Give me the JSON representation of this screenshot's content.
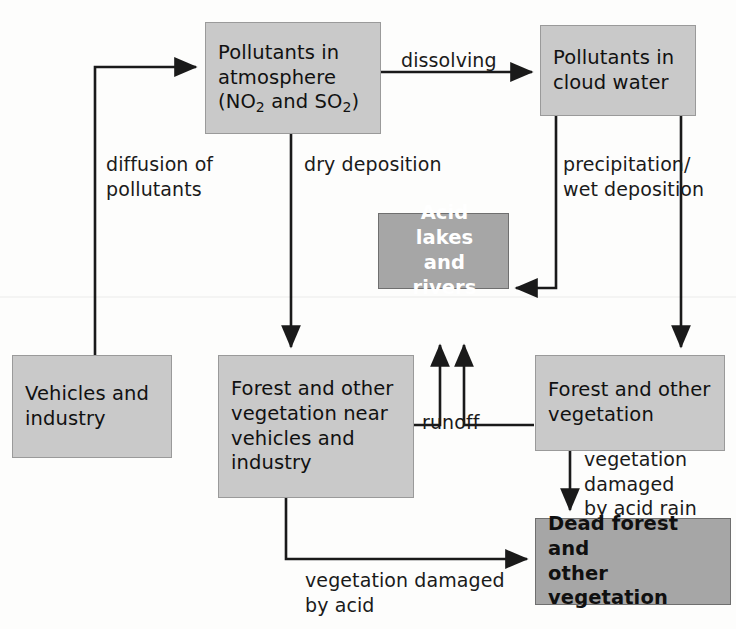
{
  "diagram": {
    "colors": {
      "box_light_fill": "#c9c9c9",
      "box_dark_fill": "#a6a6a6",
      "box_border": "#8f8f8f",
      "line": "#1a1a1a",
      "text_dark": "#111111",
      "text_light": "#ffffff",
      "background": "#fdfdfc"
    },
    "nodes": [
      {
        "id": "pollutants-atmosphere",
        "label": "Pollutants in\natmosphere\n(NO2 and SO2)",
        "label_lines": [
          "Pollutants in",
          "atmosphere",
          "(NO₂ and SO₂)"
        ],
        "style": "light"
      },
      {
        "id": "pollutants-cloud-water",
        "label": "Pollutants in\ncloud water",
        "style": "light"
      },
      {
        "id": "acid-lakes-rivers",
        "label": "Acid lakes\nand rivers",
        "style": "dark-white-text"
      },
      {
        "id": "vehicles-industry",
        "label": "Vehicles and\nindustry",
        "style": "light"
      },
      {
        "id": "forest-near-vehicles",
        "label": "Forest and other\nvegetation near\nvehicles and\nindustry",
        "style": "light"
      },
      {
        "id": "forest-other-vegetation",
        "label": "Forest and other\nvegetation",
        "style": "light"
      },
      {
        "id": "dead-forest",
        "label": "Dead forest and\nother vegetation",
        "style": "dark-bold-black"
      }
    ],
    "edges": [
      {
        "id": "diffusion",
        "label": "diffusion of\npollutants",
        "from": "vehicles-industry",
        "to": "pollutants-atmosphere"
      },
      {
        "id": "dissolving",
        "label": "dissolving",
        "from": "pollutants-atmosphere",
        "to": "pollutants-cloud-water"
      },
      {
        "id": "dry-deposition",
        "label": "dry deposition",
        "from": "pollutants-atmosphere",
        "to": "forest-near-vehicles"
      },
      {
        "id": "precipitation-wet-deposition",
        "label": "precipitation/\nwet deposition",
        "from": "pollutants-cloud-water",
        "to": "acid-lakes-rivers"
      },
      {
        "id": "wet-deposition-to-forest",
        "label": "",
        "from": "pollutants-cloud-water",
        "to": "forest-other-vegetation"
      },
      {
        "id": "runoff",
        "label": "runoff",
        "from": "forest-near-vehicles",
        "to": "acid-lakes-rivers"
      },
      {
        "id": "runoff-right",
        "label": "",
        "from": "forest-other-vegetation",
        "to": "acid-lakes-rivers"
      },
      {
        "id": "vegetation-damaged-acid-rain",
        "label": "vegetation\ndamaged\nby acid rain",
        "from": "forest-other-vegetation",
        "to": "dead-forest"
      },
      {
        "id": "vegetation-damaged-acid",
        "label": "vegetation damaged\nby acid",
        "from": "forest-near-vehicles",
        "to": "dead-forest"
      }
    ]
  }
}
